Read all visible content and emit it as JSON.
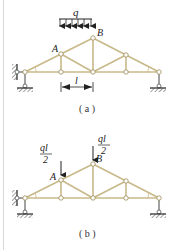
{
  "figures": [
    {
      "id": "a",
      "caption": "( a )",
      "load": {
        "type": "distributed",
        "label": "q"
      },
      "nodes": {
        "A": "A",
        "B": "B"
      },
      "dimension": {
        "label": "l"
      }
    },
    {
      "id": "b",
      "caption": "( b )",
      "loads": [
        {
          "type": "point",
          "numerator": "ql",
          "denominator": "2",
          "at": "A"
        },
        {
          "type": "point",
          "numerator": "ql",
          "denominator": "2",
          "at": "B"
        }
      ],
      "nodes": {
        "A": "A",
        "B": "B"
      }
    }
  ],
  "colors": {
    "member": "#c8b98a",
    "node_fill": "#ffffff",
    "node_stroke": "#9c8a55",
    "ink": "#222222"
  }
}
